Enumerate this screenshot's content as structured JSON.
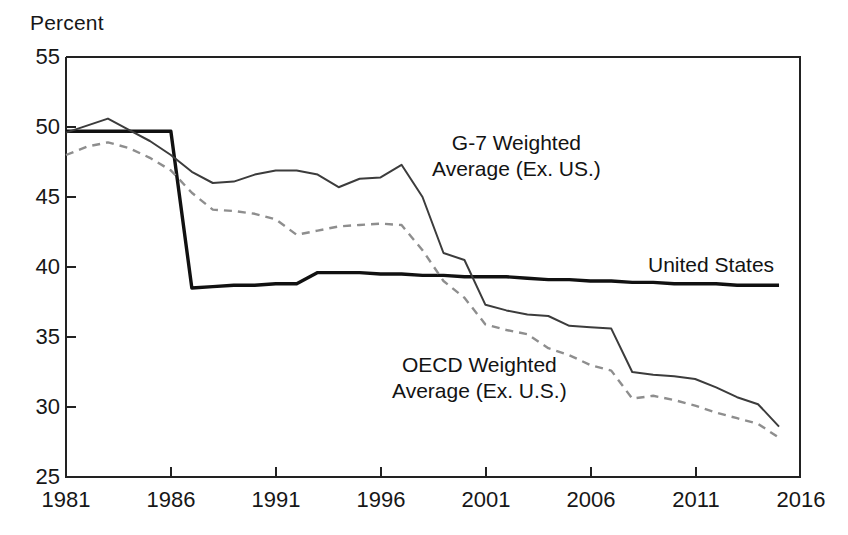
{
  "chart_data": {
    "type": "line",
    "title": "",
    "subtitle": "",
    "xlabel": "",
    "ylabel": "Percent",
    "xlim": [
      1981,
      2016
    ],
    "ylim": [
      25,
      55
    ],
    "grid": false,
    "legend_position": "inline-annotations",
    "xticks": [
      "1981",
      "1986",
      "1991",
      "1996",
      "2001",
      "2006",
      "2011",
      "2016"
    ],
    "yticks": [
      "55",
      "50",
      "45",
      "40",
      "35",
      "30",
      "25"
    ],
    "series": [
      {
        "name": "United States",
        "style": "solid-thick",
        "color": "#111111",
        "x": [
          1981,
          1982,
          1983,
          1984,
          1985,
          1986,
          1987,
          1988,
          1989,
          1990,
          1991,
          1992,
          1993,
          1994,
          1995,
          1996,
          1997,
          1998,
          1999,
          2000,
          2001,
          2002,
          2003,
          2004,
          2005,
          2006,
          2007,
          2008,
          2009,
          2010,
          2011,
          2012,
          2013,
          2014,
          2015
        ],
        "y": [
          49.7,
          49.7,
          49.7,
          49.7,
          49.7,
          49.7,
          38.5,
          38.6,
          38.7,
          38.7,
          38.8,
          38.8,
          39.6,
          39.6,
          39.6,
          39.5,
          39.5,
          39.4,
          39.4,
          39.3,
          39.3,
          39.3,
          39.2,
          39.1,
          39.1,
          39.0,
          39.0,
          38.9,
          38.9,
          38.8,
          38.8,
          38.8,
          38.7,
          38.7,
          38.7
        ]
      },
      {
        "name": "G-7 Weighted Average (Ex. US.)",
        "style": "solid-thin",
        "color": "#3c3c3c",
        "x": [
          1981,
          1982,
          1983,
          1984,
          1985,
          1986,
          1987,
          1988,
          1989,
          1990,
          1991,
          1992,
          1993,
          1994,
          1995,
          1996,
          1997,
          1998,
          1999,
          2000,
          2001,
          2002,
          2003,
          2004,
          2005,
          2006,
          2007,
          2008,
          2009,
          2010,
          2011,
          2012,
          2013,
          2014,
          2015
        ],
        "y": [
          49.6,
          50.1,
          50.6,
          49.8,
          49.0,
          48.0,
          46.8,
          46.0,
          46.1,
          46.6,
          46.9,
          46.9,
          46.6,
          45.7,
          46.3,
          46.4,
          47.3,
          45.0,
          41.0,
          40.5,
          37.3,
          36.9,
          36.6,
          36.5,
          35.8,
          35.7,
          35.6,
          32.5,
          32.3,
          32.2,
          32.0,
          31.4,
          30.7,
          30.2,
          28.6
        ]
      },
      {
        "name": "OECD Weighted Average (Ex. U.S.)",
        "style": "dashed",
        "color": "#8e8e8e",
        "x": [
          1981,
          1982,
          1983,
          1984,
          1985,
          1986,
          1987,
          1988,
          1989,
          1990,
          1991,
          1992,
          1993,
          1994,
          1995,
          1996,
          1997,
          1998,
          1999,
          2000,
          2001,
          2002,
          2003,
          2004,
          2005,
          2006,
          2007,
          2008,
          2009,
          2010,
          2011,
          2012,
          2013,
          2014,
          2015
        ],
        "y": [
          48.0,
          48.6,
          48.9,
          48.5,
          47.8,
          46.9,
          45.3,
          44.1,
          44.0,
          43.8,
          43.4,
          42.3,
          42.6,
          42.9,
          43.0,
          43.1,
          43.0,
          41.2,
          39.0,
          37.8,
          35.9,
          35.5,
          35.2,
          34.2,
          33.7,
          33.0,
          32.6,
          30.6,
          30.8,
          30.5,
          30.1,
          29.6,
          29.2,
          28.8,
          27.8
        ]
      }
    ],
    "annotations": [
      {
        "name": "g7-label",
        "line1": "G-7 Weighted",
        "line2": "Average (Ex. US.)"
      },
      {
        "name": "oecd-label",
        "line1": "OECD Weighted",
        "line2": "Average (Ex. U.S.)"
      },
      {
        "name": "us-label",
        "line1": "United States",
        "line2": ""
      }
    ]
  },
  "axis": {
    "ylabel": "Percent",
    "yticks": [
      "55",
      "50",
      "45",
      "40",
      "35",
      "30",
      "25"
    ],
    "xticks": [
      "1981",
      "1986",
      "1991",
      "1996",
      "2001",
      "2006",
      "2011",
      "2016"
    ]
  },
  "labels": {
    "g7_line1": "G-7 Weighted",
    "g7_line2": "Average (Ex. US.)",
    "oecd_line1": "OECD Weighted",
    "oecd_line2": "Average (Ex. U.S.)",
    "us": "United States"
  },
  "colors": {
    "us_line": "#111111",
    "g7_line": "#3c3c3c",
    "oecd_line": "#8e8e8e",
    "axis": "#222222",
    "background": "#ffffff"
  }
}
